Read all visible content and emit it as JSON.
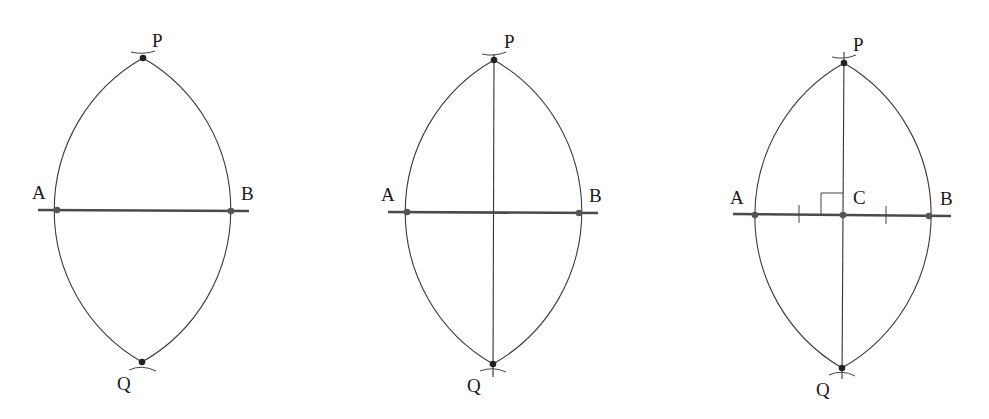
{
  "figures": [
    {
      "id": "step-1",
      "description": "Arcs drawn from A and B intersect at P and Q",
      "labels": {
        "P": "P",
        "Q": "Q",
        "A": "A",
        "B": "B"
      }
    },
    {
      "id": "step-2",
      "description": "Line PQ drawn through the intersection points",
      "labels": {
        "P": "P",
        "Q": "Q",
        "A": "A",
        "B": "B"
      }
    },
    {
      "id": "step-3",
      "description": "PQ meets AB at C; PQ is perpendicular to AB and AC = CB",
      "labels": {
        "P": "P",
        "Q": "Q",
        "A": "A",
        "B": "B",
        "C": "C"
      },
      "annotations": [
        "right-angle at C",
        "equal-length ticks on AC and CB"
      ]
    }
  ]
}
